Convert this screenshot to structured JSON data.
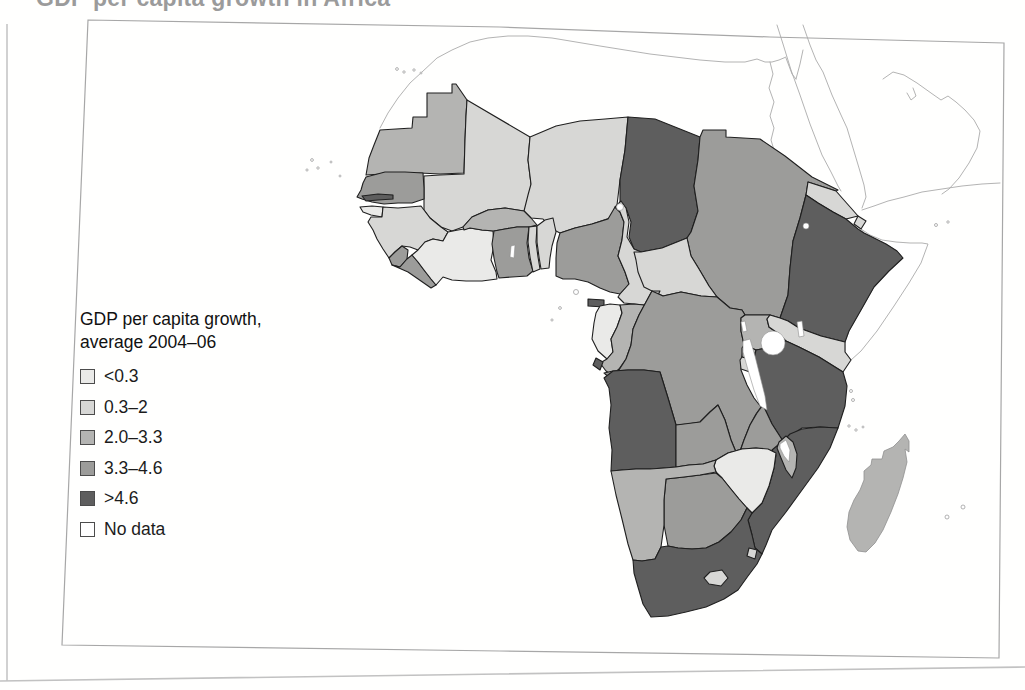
{
  "page": {
    "title": "GDP per capita growth in Africa"
  },
  "legend": {
    "title_line1": "GDP per capita growth,",
    "title_line2": "average 2004–06",
    "items": [
      {
        "label": "<0.3",
        "color": "#eaeae8"
      },
      {
        "label": "0.3–2",
        "color": "#d7d7d5"
      },
      {
        "label": "2.0–3.3",
        "color": "#b4b4b2"
      },
      {
        "label": "3.3–4.6",
        "color": "#9c9c9a"
      },
      {
        "label": ">4.6",
        "color": "#5e5e5e"
      },
      {
        "label": "No data",
        "color": "#ffffff"
      }
    ]
  },
  "map": {
    "region": "Africa",
    "countries": [
      {
        "id": "mauritania",
        "category": "2.0–3.3"
      },
      {
        "id": "mali",
        "category": "0.3–2"
      },
      {
        "id": "niger",
        "category": "0.3–2"
      },
      {
        "id": "chad",
        "category": ">4.6"
      },
      {
        "id": "sudan",
        "category": "3.3–4.6"
      },
      {
        "id": "eritrea",
        "category": "0.3–2"
      },
      {
        "id": "djibouti",
        "category": "0.3–2"
      },
      {
        "id": "ethiopia",
        "category": ">4.6"
      },
      {
        "id": "somalia",
        "category": "No data"
      },
      {
        "id": "senegal",
        "category": "3.3–4.6"
      },
      {
        "id": "gambia",
        "category": ">4.6"
      },
      {
        "id": "guinea-bissau",
        "category": "<0.3"
      },
      {
        "id": "guinea",
        "category": "0.3–2"
      },
      {
        "id": "sierra-leone",
        "category": "3.3–4.6"
      },
      {
        "id": "liberia",
        "category": "3.3–4.6"
      },
      {
        "id": "cote-divoire",
        "category": "<0.3"
      },
      {
        "id": "ghana",
        "category": "3.3–4.6"
      },
      {
        "id": "togo",
        "category": "0.3–2"
      },
      {
        "id": "benin",
        "category": "0.3–2"
      },
      {
        "id": "burkina-faso",
        "category": "2.0–3.3"
      },
      {
        "id": "nigeria",
        "category": "3.3–4.6"
      },
      {
        "id": "cameroon",
        "category": "0.3–2"
      },
      {
        "id": "central-african-republic",
        "category": "0.3–2"
      },
      {
        "id": "equatorial-guinea",
        "category": ">4.6"
      },
      {
        "id": "gabon",
        "category": "<0.3"
      },
      {
        "id": "congo",
        "category": "2.0–3.3"
      },
      {
        "id": "dr-congo",
        "category": "3.3–4.6"
      },
      {
        "id": "cabinda",
        "category": ">4.6"
      },
      {
        "id": "uganda",
        "category": "2.0–3.3"
      },
      {
        "id": "kenya",
        "category": "0.3–2"
      },
      {
        "id": "rwanda",
        "category": "2.0–3.3"
      },
      {
        "id": "burundi",
        "category": "0.3–2"
      },
      {
        "id": "tanzania",
        "category": ">4.6"
      },
      {
        "id": "angola",
        "category": ">4.6"
      },
      {
        "id": "zambia",
        "category": "3.3–4.6"
      },
      {
        "id": "malawi",
        "category": "2.0–3.3"
      },
      {
        "id": "mozambique",
        "category": ">4.6"
      },
      {
        "id": "zimbabwe",
        "category": "<0.3"
      },
      {
        "id": "botswana",
        "category": "3.3–4.6"
      },
      {
        "id": "namibia",
        "category": "2.0–3.3"
      },
      {
        "id": "south-africa",
        "category": ">4.6"
      },
      {
        "id": "lesotho",
        "category": "0.3–2"
      },
      {
        "id": "swaziland",
        "category": "0.3–2"
      },
      {
        "id": "madagascar",
        "category": "2.0–3.3"
      }
    ]
  }
}
